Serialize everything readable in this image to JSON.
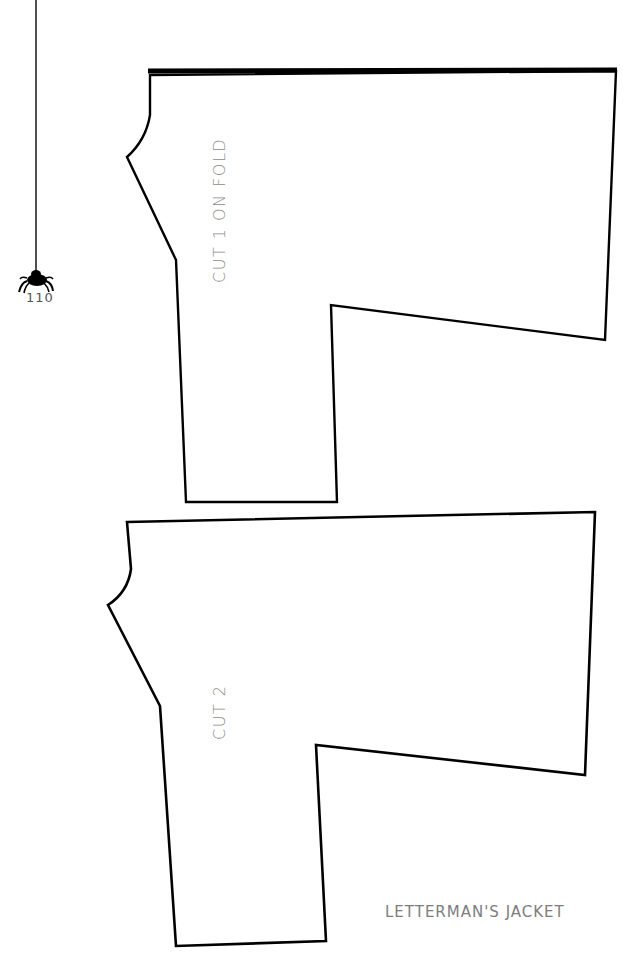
{
  "page": {
    "number": "110",
    "title": "LETTERMAN'S JACKET"
  },
  "pattern_pieces": [
    {
      "id": "piece-1",
      "label": "CUT 1 ON FOLD",
      "fold_edge": "top"
    },
    {
      "id": "piece-2",
      "label": "CUT 2"
    }
  ],
  "decoration": {
    "spider_icon": "spider-hanging-from-thread"
  },
  "colors": {
    "outline": "#000000",
    "label_text": "#8a8a8a",
    "background": "#ffffff"
  }
}
